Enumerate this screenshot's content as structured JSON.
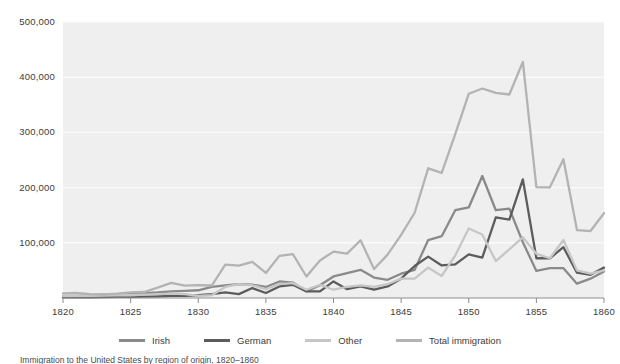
{
  "chart_data": {
    "type": "line",
    "title": "",
    "subtitle": "",
    "xlabel": "",
    "ylabel": "",
    "xlim": [
      1820,
      1860
    ],
    "ylim": [
      0,
      500000
    ],
    "grid": true,
    "grid_axis": "y",
    "legend_position": "bottom",
    "x_ticks": [
      "1820",
      "1825",
      "1830",
      "1835",
      "1840",
      "1845",
      "1850",
      "1855",
      "1860"
    ],
    "x_tick_values": [
      1820,
      1825,
      1830,
      1835,
      1840,
      1845,
      1850,
      1855,
      1860
    ],
    "y_ticks": [
      "100,000",
      "200,000",
      "300,000",
      "400,000",
      "500,000"
    ],
    "y_tick_values": [
      100000,
      200000,
      300000,
      400000,
      500000
    ],
    "x": [
      1820,
      1821,
      1822,
      1823,
      1824,
      1825,
      1826,
      1827,
      1828,
      1829,
      1830,
      1831,
      1832,
      1833,
      1834,
      1835,
      1836,
      1837,
      1838,
      1839,
      1840,
      1841,
      1842,
      1843,
      1844,
      1845,
      1846,
      1847,
      1848,
      1849,
      1850,
      1851,
      1852,
      1853,
      1854,
      1855,
      1856,
      1857,
      1858,
      1859,
      1860
    ],
    "series": [
      {
        "name": "Irish",
        "color": "#8a8a8a",
        "values": [
          3614,
          4000,
          5000,
          6000,
          7000,
          8000,
          9000,
          10000,
          12000,
          13000,
          14000,
          20000,
          23000,
          25000,
          24000,
          20000,
          30000,
          28000,
          12000,
          23000,
          39000,
          45000,
          51000,
          37000,
          33000,
          44000,
          51000,
          105000,
          112000,
          159000,
          164000,
          221000,
          159000,
          162000,
          101000,
          49000,
          54000,
          54000,
          26000,
          35000,
          48000
        ]
      },
      {
        "name": "German",
        "color": "#5c5c5c",
        "values": [
          968,
          1000,
          1000,
          1500,
          2000,
          2000,
          2500,
          3000,
          4000,
          4000,
          5000,
          7000,
          10000,
          7000,
          18000,
          9000,
          21000,
          24000,
          12000,
          12000,
          30000,
          16000,
          21000,
          15000,
          21000,
          35000,
          58000,
          75000,
          59000,
          61000,
          79000,
          73000,
          146000,
          142000,
          215000,
          72000,
          72000,
          92000,
          46000,
          42000,
          55000
        ]
      },
      {
        "name": "Other",
        "color": "#c6c6c6",
        "values": [
          3500,
          4000,
          4000,
          4500,
          5000,
          5000,
          6000,
          7000,
          8000,
          7000,
          4000,
          5000,
          20000,
          25000,
          23000,
          16000,
          25000,
          27000,
          15000,
          24000,
          15000,
          20000,
          23000,
          20000,
          25000,
          35000,
          35000,
          55000,
          40000,
          77000,
          126000,
          115000,
          67000,
          88000,
          110000,
          80000,
          72000,
          105000,
          50000,
          44000,
          50000
        ]
      },
      {
        "name": "Total immigration",
        "color": "#b3b3b3",
        "values": [
          8385,
          9127,
          6911,
          6354,
          7912,
          10199,
          10837,
          18875,
          27382,
          22520,
          23322,
          22633,
          60482,
          58640,
          65365,
          45374,
          76242,
          79340,
          38914,
          68069,
          84066,
          80289,
          104565,
          52496,
          78615,
          114371,
          154416,
          234968,
          226527,
          297024,
          369980,
          379466,
          371603,
          368645,
          427833,
          200877,
          200436,
          251306,
          123126,
          121282,
          153640
        ]
      }
    ]
  },
  "legend": {
    "items": [
      {
        "label": "Irish",
        "color": "#8a8a8a"
      },
      {
        "label": "German",
        "color": "#5c5c5c"
      },
      {
        "label": "Other",
        "color": "#c6c6c6"
      },
      {
        "label": "Total immigration",
        "color": "#b3b3b3"
      }
    ]
  },
  "caption": {
    "text": "Immigration to the United States by region of origin, 1820–1860"
  },
  "style": {
    "panel_background": "#efefef",
    "gridline_color": "#fbfbfb",
    "axis_color": "#888888",
    "text_color": "#3b3b3b"
  }
}
